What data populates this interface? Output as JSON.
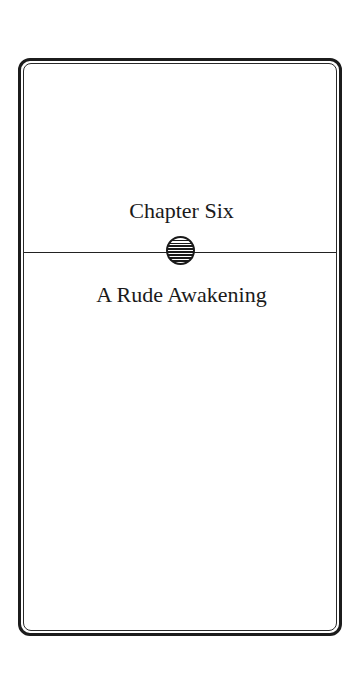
{
  "page": {
    "chapter_label": "Chapter Six",
    "chapter_title": "A Rude Awakening",
    "ornament_icon": "striped-circle-ornament",
    "colors": {
      "ink": "#1a1a1a",
      "background": "#ffffff"
    }
  }
}
